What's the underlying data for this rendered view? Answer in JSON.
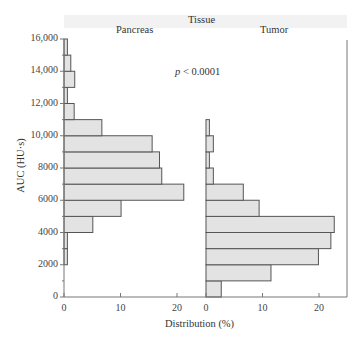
{
  "chart_data": {
    "type": "bar",
    "orientation": "horizontal-histogram",
    "title": "Tissue",
    "annotation": "p < 0.0001",
    "ylabel": "AUC (HU·s)",
    "xlabel": "Distribution (%)",
    "ylim": [
      0,
      16000
    ],
    "y_ticks": [
      "0",
      "2000",
      "4000",
      "6000",
      "8000",
      "10,000",
      "12,000",
      "14,000",
      "16,000"
    ],
    "x_ticks": [
      "0",
      "10",
      "20"
    ],
    "bin_width": 1000,
    "bins": [
      "0-1000",
      "1000-2000",
      "2000-3000",
      "3000-4000",
      "4000-5000",
      "5000-6000",
      "6000-7000",
      "7000-8000",
      "8000-9000",
      "9000-10000",
      "10000-11000",
      "11000-12000",
      "12000-13000",
      "13000-14000",
      "14000-15000",
      "15000-16000"
    ],
    "series": [
      {
        "name": "Pancreas",
        "values": [
          0,
          0,
          0.6,
          0.6,
          5.1,
          10.1,
          21.2,
          17.3,
          16.9,
          15.6,
          6.7,
          1.8,
          0.6,
          1.9,
          1.2,
          0.6
        ]
      },
      {
        "name": "Tumor",
        "values": [
          2.7,
          11.5,
          19.9,
          22.1,
          22.7,
          9.4,
          6.6,
          1.3,
          0.6,
          1.3,
          0.6,
          0,
          0,
          0,
          0,
          0
        ]
      }
    ],
    "grid": false,
    "legend": "panel titles"
  },
  "labels": {
    "title": "Tissue",
    "panel_left": "Pancreas",
    "panel_right": "Tumor",
    "p_prefix": "p",
    "p_suffix": " < 0.0001",
    "ylabel": "AUC (HU·s)",
    "xlabel": "Distribution (%)"
  },
  "colors": {
    "bar_fill": "#e3e3e3",
    "bar_stroke": "#555555",
    "axis": "#777777",
    "header_strip": "#f2f2f2"
  }
}
